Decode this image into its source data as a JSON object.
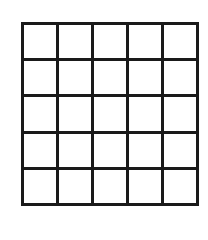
{
  "grid": {
    "rows": 5,
    "columns": 5,
    "line_color": "#1a1a1a",
    "cell_color": "#ffffff",
    "cells": [
      [
        "",
        "",
        "",
        "",
        ""
      ],
      [
        "",
        "",
        "",
        "",
        ""
      ],
      [
        "",
        "",
        "",
        "",
        ""
      ],
      [
        "",
        "",
        "",
        "",
        ""
      ],
      [
        "",
        "",
        "",
        "",
        ""
      ]
    ]
  }
}
